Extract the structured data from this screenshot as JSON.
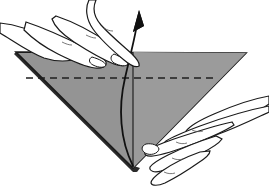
{
  "figure": {
    "name": "origami-fold-step-diagram",
    "alt_text": "Two hands hold a gray triangular folded paper; a curved arrow indicates lifting the front layer upward along the vertical center crease.",
    "background_color": "#ffffff",
    "canvas": {
      "width": 269,
      "height": 186
    }
  },
  "paper": {
    "name": "triangle-paper",
    "shape": "inverted-triangle",
    "fill_color": "#949494",
    "edge_color": "#1a1a1a",
    "thickness_color": "#2b2b2b",
    "vertices": {
      "left": [
        16,
        52
      ],
      "right": [
        246,
        53
      ],
      "bottom": [
        133,
        168
      ]
    },
    "crease_vertical": {
      "name": "center-crease-line",
      "from": [
        133,
        52
      ],
      "to": [
        133,
        168
      ],
      "style": "solid",
      "color": "#2a2a2a"
    },
    "crease_dashed": {
      "name": "horizontal-fold-dashed-line",
      "from": [
        26,
        78
      ],
      "to": [
        216,
        78
      ],
      "style": "dashed",
      "dash_pattern": "7 5",
      "color": "#1f1f1f"
    }
  },
  "arrow": {
    "name": "fold-direction-arrow",
    "description": "curved arrow sweeping up from bottom vertex",
    "color": "#111111",
    "tip": [
      139,
      11
    ],
    "tail": [
      133,
      166
    ],
    "head_style": "solid-triangle"
  },
  "hands": [
    {
      "name": "left-hand",
      "position": "upper-left",
      "role": "holds the top-left edge of the paper",
      "fingers": 3,
      "skin_fill": "#ffffff",
      "outline_color": "#1a1a1a"
    },
    {
      "name": "right-hand",
      "position": "lower-right",
      "role": "lifts the front flap near the bottom vertex",
      "fingers": 4,
      "skin_fill": "#ffffff",
      "outline_color": "#1a1a1a"
    }
  ],
  "labels": {
    "caption": "",
    "step_number": ""
  }
}
